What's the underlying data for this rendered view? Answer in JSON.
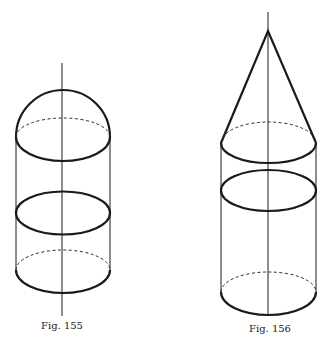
{
  "figures": [
    {
      "id": "fig-155",
      "caption": "Fig. 155",
      "shape": "cylinder with hemispherical cap",
      "parts": [
        "axis",
        "hemisphere",
        "rim ellipse",
        "middle ellipse",
        "bottom ellipse"
      ]
    },
    {
      "id": "fig-156",
      "caption": "Fig. 156",
      "shape": "cylinder with conical cap",
      "parts": [
        "axis",
        "cone",
        "cone base ellipse",
        "middle ellipse",
        "bottom ellipse"
      ]
    }
  ],
  "colors": {
    "ink": "#1a1a1a",
    "background": "#ffffff"
  }
}
